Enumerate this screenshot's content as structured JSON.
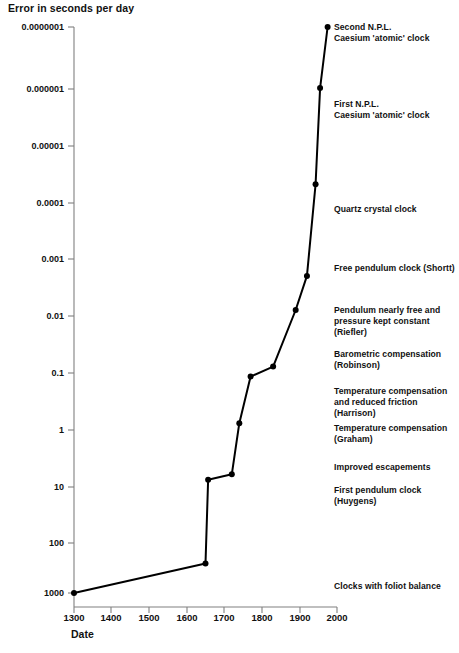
{
  "chart": {
    "title": "Error in seconds per day",
    "xlabel": "Date"
  },
  "chart_data": {
    "type": "line",
    "title": "Error in seconds per day",
    "xlabel": "Date",
    "ylabel": "Error in seconds per day",
    "yscale": "log",
    "ylim": [
      1e-07,
      1000
    ],
    "xlim": [
      1300,
      2000
    ],
    "grid": false,
    "legend": null,
    "y_ticklabels": [
      "0.0000001",
      "0.000001",
      "0.00001",
      "0.0001",
      "0.001",
      "0.01",
      "0.1",
      "1",
      "10",
      "100",
      "1000"
    ],
    "y_tickvalues": [
      1e-07,
      1e-06,
      1e-05,
      0.0001,
      0.001,
      0.01,
      0.1,
      1,
      10,
      100,
      1000
    ],
    "x_ticklabels": [
      "1300",
      "1400",
      "1500",
      "1600",
      "1700",
      "1800",
      "1900",
      "2000"
    ],
    "x_tickvalues": [
      1300,
      1400,
      1500,
      1600,
      1700,
      1800,
      1900,
      2000
    ],
    "x": [
      1300,
      1650,
      1657,
      1720,
      1740,
      1770,
      1830,
      1890,
      1920,
      1943,
      1955,
      1975
    ],
    "y": [
      1000,
      300,
      10,
      8,
      1,
      0.15,
      0.1,
      0.01,
      0.0025,
      6e-05,
      1.2e-06,
      1e-07
    ],
    "markers": "filled-circle",
    "annotations": [
      {
        "text": "Second N.P.L.\nCaesium 'atomic' clock",
        "x": 1975,
        "y": 1e-07
      },
      {
        "text": "First N.P.L.\nCaesium 'atomic' clock",
        "x": 1955,
        "y": 1.2e-06
      },
      {
        "text": "Quartz crystal clock",
        "x": 1943,
        "y": 6e-05
      },
      {
        "text": "Free pendulum clock (Shortt)",
        "x": 1920,
        "y": 0.0025
      },
      {
        "text": "Pendulum nearly free and\npressure kept constant (Riefler)",
        "x": 1890,
        "y": 0.01
      },
      {
        "text": "Barometric compensation\n(Robinson)",
        "x": 1830,
        "y": 0.1
      },
      {
        "text": "Temperature compensation\nand reduced friction (Harrison)",
        "x": 1770,
        "y": 0.15
      },
      {
        "text": "Temperature compensation\n(Graham)",
        "x": 1740,
        "y": 1
      },
      {
        "text": "Improved escapements",
        "x": 1720,
        "y": 8
      },
      {
        "text": "First pendulum clock (Huygens)",
        "x": 1657,
        "y": 10
      },
      {
        "text": "Clocks with foliot balance",
        "x": 1650,
        "y": 300
      }
    ]
  },
  "y_ticks": [
    {
      "label": "0.0000001",
      "top": 27
    },
    {
      "label": "0.000001",
      "top": 89
    },
    {
      "label": "0.00001",
      "top": 146
    },
    {
      "label": "0.0001",
      "top": 203
    },
    {
      "label": "0.001",
      "top": 259
    },
    {
      "label": "0.01",
      "top": 316
    },
    {
      "label": "0.1",
      "top": 373
    },
    {
      "label": "1",
      "top": 430
    },
    {
      "label": "10",
      "top": 487
    },
    {
      "label": "100",
      "top": 543
    },
    {
      "label": "1000",
      "top": 593
    }
  ],
  "x_ticks": [
    {
      "label": "1300",
      "left": 74
    },
    {
      "label": "1400",
      "left": 111
    },
    {
      "label": "1500",
      "left": 149
    },
    {
      "label": "1600",
      "left": 187
    },
    {
      "label": "1700",
      "left": 224
    },
    {
      "label": "1800",
      "left": 262
    },
    {
      "label": "1900",
      "left": 300
    },
    {
      "label": "2000",
      "left": 337
    }
  ],
  "annotation_blocks": [
    {
      "text": "Second N.P.L.\nCaesium 'atomic' clock",
      "left": 334,
      "top": 22
    },
    {
      "text": "First N.P.L.\nCaesium 'atomic' clock",
      "left": 334,
      "top": 99
    },
    {
      "text": "Quartz crystal clock",
      "left": 334,
      "top": 204
    },
    {
      "text": "Free pendulum clock (Shortt)",
      "left": 334,
      "top": 263
    },
    {
      "text": "Pendulum nearly free and\npressure kept constant (Riefler)",
      "left": 334,
      "top": 305
    },
    {
      "text": "Barometric compensation\n(Robinson)",
      "left": 334,
      "top": 349
    },
    {
      "text": "Temperature compensation\nand reduced friction (Harrison)",
      "left": 334,
      "top": 386
    },
    {
      "text": "Temperature compensation\n(Graham)",
      "left": 334,
      "top": 423
    },
    {
      "text": "Improved escapements",
      "left": 334,
      "top": 462
    },
    {
      "text": "First pendulum clock (Huygens)",
      "left": 334,
      "top": 485
    },
    {
      "text": "Clocks with foliot balance",
      "left": 334,
      "top": 581
    }
  ],
  "geometry": {
    "axis_color": "#808080",
    "line_color": "#000000",
    "marker_color": "#000000",
    "x_left_px": 74,
    "x_right_px": 337,
    "y_top_px": 27,
    "y_bottom_px": 593,
    "x_min": 1300,
    "x_max": 2000,
    "log_y_top": -7,
    "log_y_bottom": 3
  }
}
